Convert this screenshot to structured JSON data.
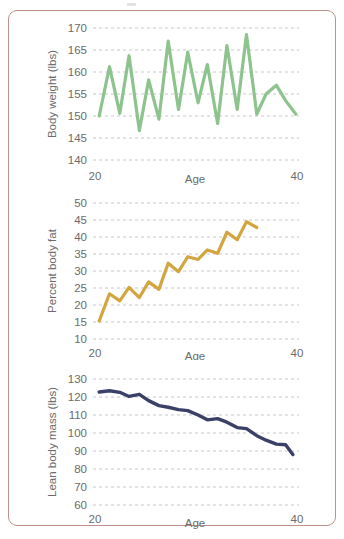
{
  "figure": {
    "border_color": "#c0928c",
    "background": "#ffffff"
  },
  "chart_data": [
    {
      "type": "line",
      "title": "",
      "xlabel": "Age",
      "ylabel": "Body weight (lbs)",
      "xlim": [
        20,
        40
      ],
      "ylim": [
        140,
        170
      ],
      "xticks": [
        "20",
        "40"
      ],
      "yticks": [
        "140",
        "145",
        "150",
        "155",
        "160",
        "165",
        "170"
      ],
      "grid": true,
      "legend": "none",
      "color": "#8dc38d",
      "x": [
        20.6,
        21.6,
        22.6,
        23.5,
        24.5,
        25.4,
        26.4,
        27.3,
        28.3,
        29.2,
        30.2,
        31.1,
        32.1,
        33.0,
        34.0,
        34.9,
        35.9,
        36.8,
        37.8,
        38.7,
        39.7
      ],
      "values": [
        150.0,
        161.2,
        150.6,
        163.7,
        146.7,
        158.2,
        149.3,
        167.0,
        151.5,
        164.5,
        153.0,
        161.7,
        148.3,
        166.0,
        151.5,
        168.5,
        150.4,
        155.0,
        157.0,
        153.5,
        150.4
      ]
    },
    {
      "type": "line",
      "title": "",
      "xlabel": "Age",
      "ylabel": "Percent body fat",
      "xlim": [
        20,
        40
      ],
      "ylim": [
        10,
        50
      ],
      "xticks": [
        "20",
        "40"
      ],
      "yticks": [
        "10",
        "15",
        "20",
        "25",
        "30",
        "35",
        "40",
        "45",
        "50"
      ],
      "grid": true,
      "legend": "none",
      "color": "#d3a53e",
      "x": [
        20.6,
        21.6,
        22.6,
        23.5,
        24.5,
        25.4,
        26.4,
        27.3,
        28.3,
        29.2,
        30.2,
        31.1,
        32.1,
        33.0,
        34.0,
        34.9,
        35.9,
        36.8,
        37.8,
        38.7
      ],
      "values": [
        15.3,
        23.3,
        21.2,
        25.2,
        22.2,
        26.8,
        24.6,
        32.3,
        29.8,
        34.2,
        33.4,
        36.2,
        35.2,
        41.4,
        39.2,
        44.5,
        42.8
      ]
    },
    {
      "type": "line",
      "title": "",
      "xlabel": "Age",
      "ylabel": "Lean body mass (lbs)",
      "xlim": [
        20,
        40
      ],
      "ylim": [
        60,
        130
      ],
      "xticks": [
        "20",
        "40"
      ],
      "yticks": [
        "60",
        "70",
        "80",
        "90",
        "100",
        "110",
        "120",
        "130"
      ],
      "grid": true,
      "legend": "none",
      "color": "#3a4068",
      "x": [
        20.6,
        21.6,
        22.6,
        23.5,
        24.5,
        25.4,
        26.4,
        27.3,
        28.3,
        29.2,
        30.2,
        31.1,
        32.1,
        33.0,
        34.0,
        34.9,
        35.9,
        36.8,
        37.8,
        38.7,
        39.4
      ],
      "values": [
        122.8,
        123.5,
        122.6,
        120.3,
        121.5,
        118.0,
        115.2,
        114.3,
        113.0,
        112.4,
        110.0,
        107.3,
        108.0,
        106.0,
        103.0,
        102.4,
        98.5,
        96.0,
        93.8,
        93.5,
        88.0
      ]
    }
  ]
}
